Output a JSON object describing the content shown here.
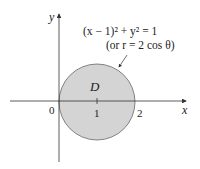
{
  "diagram": {
    "region_label": "D",
    "equation_line1": "(x − 1)² + y² = 1",
    "equation_line2": "(or r = 2 cos θ)",
    "axes": {
      "x_label": "x",
      "y_label": "y"
    },
    "ticks": {
      "origin": "0",
      "one": "1",
      "two": "2"
    },
    "colors": {
      "fill": "#d4d4d4",
      "stroke": "#555555",
      "axis": "#333333"
    }
  }
}
